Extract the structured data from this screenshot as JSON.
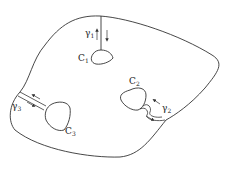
{
  "diagram": {
    "stroke_color": "#333333",
    "background": "#ffffff",
    "labels": {
      "c1": {
        "base": "C",
        "sub": "1"
      },
      "c2": {
        "base": "C",
        "sub": "2"
      },
      "c3": {
        "base": "C",
        "sub": "3"
      },
      "g1": {
        "base": "γ",
        "sub": "1"
      },
      "g2": {
        "base": "γ",
        "sub": "2"
      },
      "g3": {
        "base": "γ",
        "sub": "3"
      }
    }
  }
}
